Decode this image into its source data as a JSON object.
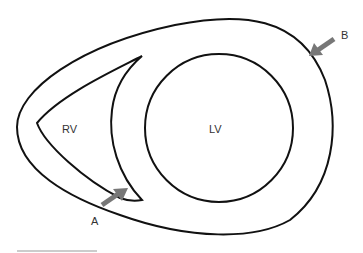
{
  "diagram": {
    "labels": {
      "rv": "RV",
      "lv": "LV",
      "arrow_a": "A",
      "arrow_b": "B"
    },
    "colors": {
      "outline": "#111111",
      "arrow": "#777777",
      "text": "#333333",
      "footer_line": "#bbbbbb"
    }
  }
}
